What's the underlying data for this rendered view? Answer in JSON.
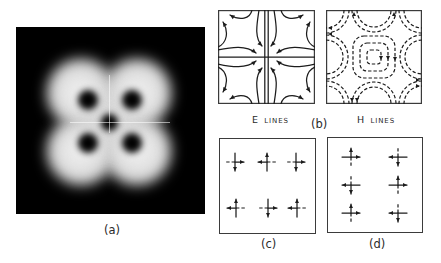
{
  "colors": {
    "background": "#ffffff",
    "image_background": "#000000",
    "intensity_light": "#d6d6d6",
    "ink": "#1c1c1c",
    "frame": "#3b3b3b"
  },
  "panels": {
    "a": {
      "label": "(a)",
      "content": "four-lobed bright intensity pattern with four dark nulls and a dark center on black background"
    },
    "b": {
      "label": "(b)",
      "e_lines": {
        "caption_main": "E",
        "caption_rest": "LINES"
      },
      "h_lines": {
        "caption_main": "H",
        "caption_rest": "LINES"
      }
    },
    "c": {
      "label": "(c)",
      "dashed_axis": "horizontal",
      "crosses": [
        {
          "x": 16,
          "y": 24,
          "h": "right",
          "v": "down"
        },
        {
          "x": 48,
          "y": 24,
          "h": "left",
          "v": "up"
        },
        {
          "x": 77,
          "y": 24,
          "h": "right",
          "v": "down"
        },
        {
          "x": 17,
          "y": 70,
          "h": "left",
          "v": "up"
        },
        {
          "x": 49,
          "y": 70,
          "h": "right",
          "v": "down"
        },
        {
          "x": 78,
          "y": 70,
          "h": "left",
          "v": "up"
        }
      ]
    },
    "d": {
      "label": "(d)",
      "dashed_axis": "vertical",
      "crosses": [
        {
          "x": 24,
          "y": 20,
          "h": "right",
          "v": "up"
        },
        {
          "x": 71,
          "y": 20,
          "h": "left",
          "v": "down"
        },
        {
          "x": 24,
          "y": 48,
          "h": "left",
          "v": "down"
        },
        {
          "x": 71,
          "y": 48,
          "h": "right",
          "v": "up"
        },
        {
          "x": 24,
          "y": 76,
          "h": "right",
          "v": "up"
        },
        {
          "x": 71,
          "y": 76,
          "h": "left",
          "v": "down"
        }
      ]
    }
  }
}
